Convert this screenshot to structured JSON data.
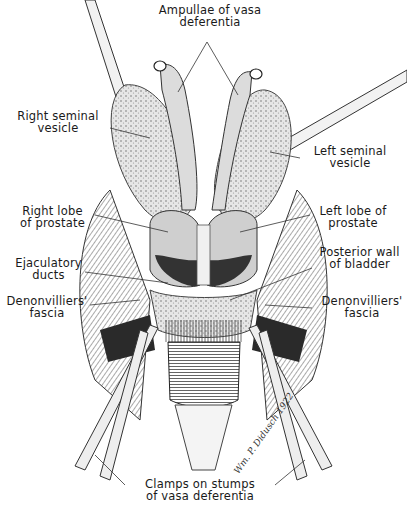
{
  "figure": {
    "type": "anatomical illustration",
    "signature": "Wm. P. Didusch",
    "signature_year": "1922"
  },
  "labels": {
    "ampullae": {
      "line1": "Ampullae of vasa",
      "line2": "deferentia"
    },
    "right_seminal_vesicle": {
      "line1": "Right seminal",
      "line2": "vesicle"
    },
    "left_seminal_vesicle": {
      "line1": "Left seminal",
      "line2": "vesicle"
    },
    "right_lobe_prostate": {
      "line1": "Right lobe",
      "line2": "of prostate"
    },
    "left_lobe_prostate": {
      "line1": "Left lobe of",
      "line2": "prostate"
    },
    "ejaculatory_ducts": {
      "line1": "Ejaculatory",
      "line2": "ducts"
    },
    "posterior_wall_bladder": {
      "line1": "Posterior wall",
      "line2": "of bladder"
    },
    "denonvilliers_right": {
      "line1": "Denonvilliers'",
      "line2": "fascia"
    },
    "denonvilliers_left": {
      "line1": "Denonvilliers'",
      "line2": "fascia"
    },
    "clamps": {
      "line1": "Clamps on stumps",
      "line2": "of vasa deferentia"
    }
  },
  "colors": {
    "ink": "#1a1a1a",
    "background": "#ffffff",
    "tissue_light": "#d9d9d9",
    "tissue_mid": "#9a9a9a",
    "tissue_dark": "#3a3a3a"
  }
}
